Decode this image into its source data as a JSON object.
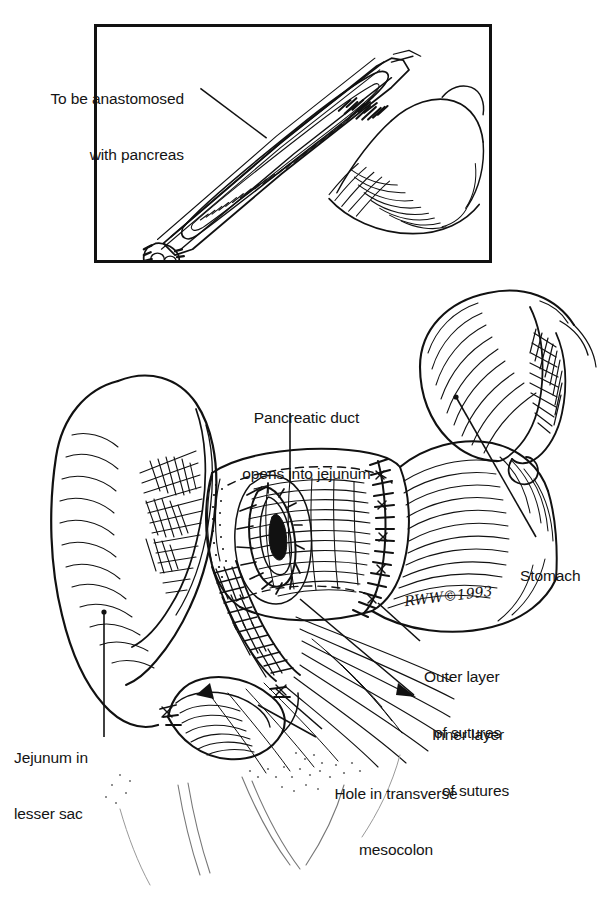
{
  "figure": {
    "type": "medical-surgical-illustration",
    "artist_signature": "RWW©1993",
    "copyright_year": "1993",
    "ink_color": "#111111",
    "background_color": "#ffffff"
  },
  "inset": {
    "title": "",
    "border_color": "#111111",
    "labels": [
      {
        "id": "to-be-anastomosed",
        "line1": "To be anastomosed",
        "line2": "with pancreas",
        "leader": "diagonal-down-right"
      }
    ]
  },
  "main": {
    "labels": [
      {
        "id": "pancreatic-duct",
        "line1": "Pancreatic duct",
        "line2": "opens into jejunum",
        "leader": "vertical-down"
      },
      {
        "id": "stomach",
        "line1": "Stomach",
        "line2": "",
        "leader": "diagonal-up-left"
      },
      {
        "id": "outer-layer",
        "line1": "Outer layer",
        "line2": "of sutures",
        "leader": "diagonal-up-left"
      },
      {
        "id": "inner-layer",
        "line1": "Inner layer",
        "line2": "of sutures",
        "leader": "diagonal-up-left"
      },
      {
        "id": "hole-in-mesocolon",
        "line1": "Hole in transverse",
        "line2": "mesocolon",
        "leader": "diagonal-up-left"
      },
      {
        "id": "jejunum-lesser-sac",
        "line1": "Jejunum in",
        "line2": "lesser sac",
        "leader": "vertical-up"
      }
    ]
  }
}
